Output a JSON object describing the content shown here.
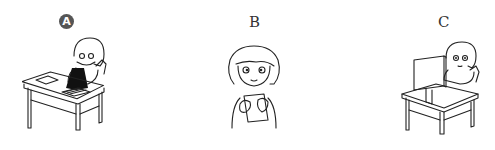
{
  "options": [
    {
      "label": "A",
      "selected": true,
      "description": "girl sitting at desk folding dark clothing, papers on desk"
    },
    {
      "label": "B",
      "selected": false,
      "description": "girl holding a card/paper with both hands"
    },
    {
      "label": "C",
      "selected": false,
      "description": "girl sitting at desk using a computer monitor"
    }
  ],
  "colors": {
    "selected_marker": "#555555",
    "line": "#222222",
    "background": "#ffffff"
  }
}
